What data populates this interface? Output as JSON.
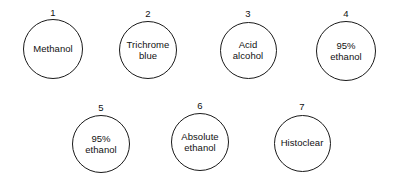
{
  "diagram": {
    "type": "flow-steps",
    "background_color": "#ffffff",
    "circle_stroke_color": "#1a1a1a",
    "text_color": "#111111",
    "rows": [
      {
        "row_name": "top-row",
        "steps": [
          {
            "number": "1",
            "label": "Methanol",
            "cx": 53,
            "cy": 49,
            "d": 60,
            "num_y": 8
          },
          {
            "number": "2",
            "label": "Trichrome\nblue",
            "cx": 148,
            "cy": 50,
            "d": 58,
            "num_y": 9
          },
          {
            "number": "3",
            "label": "Acid\nalcohol",
            "cx": 248,
            "cy": 50,
            "d": 57,
            "num_y": 9
          },
          {
            "number": "4",
            "label": "95%\nethanol",
            "cx": 346,
            "cy": 51,
            "d": 60,
            "num_y": 9
          }
        ]
      },
      {
        "row_name": "bottom-row",
        "steps": [
          {
            "number": "5",
            "label": "95%\nethanol",
            "cx": 101,
            "cy": 144,
            "d": 58,
            "num_y": 103
          },
          {
            "number": "6",
            "label": "Absolute\nethanol",
            "cx": 200,
            "cy": 142,
            "d": 58,
            "num_y": 101
          },
          {
            "number": "7",
            "label": "Histoclear",
            "cx": 302,
            "cy": 143,
            "d": 57,
            "num_y": 102
          }
        ]
      }
    ]
  }
}
